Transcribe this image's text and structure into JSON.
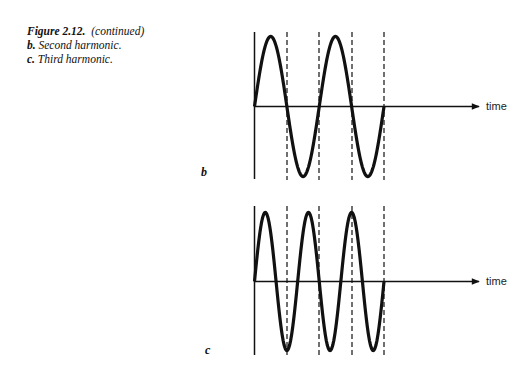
{
  "caption": {
    "figure": "Figure 2.12.",
    "note": "(continued)",
    "items": [
      {
        "letter": "b.",
        "text": "Second harmonic."
      },
      {
        "letter": "c.",
        "text": "Third harmonic."
      }
    ]
  },
  "chart_data": [
    {
      "type": "line",
      "panel": "b",
      "title": "Second harmonic",
      "xlabel": "time",
      "ylabel": "",
      "cycles": 2,
      "grid": "dashed vertical lines at half-periods",
      "x": [
        0,
        0.25,
        0.5,
        0.75,
        1,
        1.25,
        1.5,
        1.75,
        2,
        2.25,
        2.5,
        2.75,
        3,
        3.25,
        3.5,
        3.75,
        4
      ],
      "values": [
        0,
        1,
        0,
        -1,
        0,
        1,
        0,
        -1,
        0,
        1,
        0,
        -1,
        0,
        1,
        0,
        -1,
        0
      ],
      "dashed_lines_at": [
        1,
        2,
        3,
        4
      ]
    },
    {
      "type": "line",
      "panel": "c",
      "title": "Third harmonic",
      "xlabel": "time",
      "ylabel": "",
      "cycles": 3,
      "grid": "dashed vertical lines",
      "values_description": "sine wave with 3 cycles over same interval",
      "dashed_lines_at": [
        1,
        2,
        3,
        4
      ]
    }
  ],
  "panels": {
    "b": {
      "label": "b",
      "axis_label": "time"
    },
    "c": {
      "label": "c",
      "axis_label": "time"
    }
  }
}
